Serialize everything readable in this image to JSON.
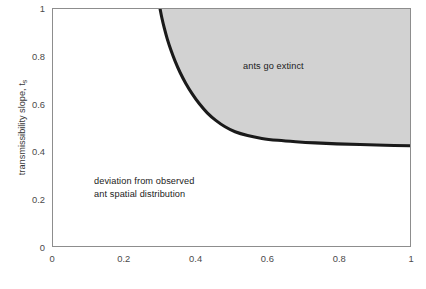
{
  "chart_data": {
    "type": "area",
    "title": "",
    "xlabel": "",
    "ylabel": "transmissibility slope, t",
    "ylabel_subscript": "s",
    "xlim": [
      0,
      1
    ],
    "ylim": [
      0,
      1
    ],
    "grid": false,
    "legend": "none",
    "xticks": [
      "0",
      "0.2",
      "0.4",
      "0.6",
      "0.8",
      "1"
    ],
    "xtick_values": [
      0,
      0.2,
      0.4,
      0.6,
      0.8,
      1
    ],
    "yticks": [
      "0",
      "0.2",
      "0.4",
      "0.6",
      "0.8",
      "1"
    ],
    "ytick_values": [
      0,
      0.2,
      0.4,
      0.6,
      0.8,
      1
    ],
    "series": [
      {
        "name": "extinction boundary",
        "kind": "threshold-curve",
        "line_color": "#1a1a1a",
        "line_width": 3.1,
        "x": [
          0.3,
          0.305,
          0.312,
          0.32,
          0.33,
          0.342,
          0.356,
          0.372,
          0.39,
          0.41,
          0.432,
          0.456,
          0.482,
          0.51,
          0.545,
          0.585,
          0.63,
          0.68,
          0.735,
          0.795,
          0.86,
          0.93,
          1.0
        ],
        "y": [
          1.0,
          0.962,
          0.918,
          0.874,
          0.828,
          0.78,
          0.732,
          0.686,
          0.642,
          0.6,
          0.562,
          0.53,
          0.503,
          0.482,
          0.466,
          0.454,
          0.446,
          0.44,
          0.435,
          0.431,
          0.428,
          0.425,
          0.423
        ]
      }
    ],
    "regions": [
      {
        "name": "extinction-region",
        "label": "ants go extinct",
        "fill_color": "#d2d2d2",
        "description": "shaded region above and right of the threshold curve"
      },
      {
        "name": "deviation-region",
        "label": "deviation from observed ant spatial distribution",
        "fill_color": "#ffffff",
        "description": "unshaded region below and left of the threshold curve"
      }
    ],
    "annotations": [
      {
        "text": "ants go extinct",
        "x": 0.64,
        "y": 0.72
      },
      {
        "text": "deviation from observed",
        "x": 0.12,
        "y": 0.295
      },
      {
        "text": "ant spatial distribution",
        "x": 0.12,
        "y": 0.24
      }
    ]
  },
  "axes": {
    "y_title_main": "transmissibility slope, t",
    "y_title_sub": "s"
  },
  "annotations": {
    "extinct": "ants go extinct",
    "deviation_line1": "deviation from observed",
    "deviation_line2": "ant spatial distribution"
  },
  "colors": {
    "curve": "#1a1a1a",
    "shaded_region": "#d2d2d2",
    "frame": "#8d8d8d",
    "tick_text": "#4b4b4b",
    "annotation_text": "#1b1b1b",
    "background": "#ffffff"
  }
}
